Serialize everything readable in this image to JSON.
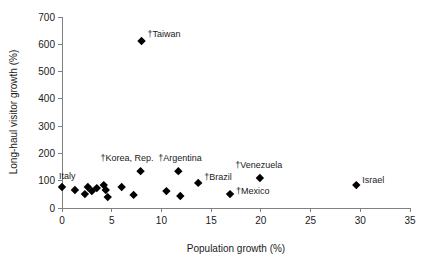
{
  "chart_data": {
    "type": "scatter",
    "title": "",
    "xlabel": "Population growth (%)",
    "ylabel": "Long-haul visitor growth (%)",
    "xlim": [
      0,
      35
    ],
    "ylim": [
      0,
      700
    ],
    "xticks": [
      0,
      5,
      10,
      15,
      20,
      25,
      30,
      35
    ],
    "yticks": [
      0,
      100,
      200,
      300,
      400,
      500,
      600,
      700
    ],
    "grid": false,
    "legend": "none",
    "marker": "filled-diamond",
    "marker_color": "#000000",
    "points": [
      {
        "label": "Italy",
        "label_text": "Italy",
        "x": 0.0,
        "y": 77,
        "label_dx": -3,
        "label_dy": -8,
        "anchor": "start"
      },
      {
        "label": "",
        "label_text": "",
        "x": 1.3,
        "y": 66,
        "label_dx": 0,
        "label_dy": 0,
        "anchor": "start"
      },
      {
        "label": "",
        "label_text": "",
        "x": 2.3,
        "y": 51,
        "label_dx": 0,
        "label_dy": 0,
        "anchor": "start"
      },
      {
        "label": "",
        "label_text": "",
        "x": 2.6,
        "y": 77,
        "label_dx": 0,
        "label_dy": 0,
        "anchor": "start"
      },
      {
        "label": "",
        "label_text": "",
        "x": 3.0,
        "y": 62,
        "label_dx": 0,
        "label_dy": 0,
        "anchor": "start"
      },
      {
        "label": "",
        "label_text": "",
        "x": 3.5,
        "y": 73,
        "label_dx": 0,
        "label_dy": 0,
        "anchor": "start"
      },
      {
        "label": "",
        "label_text": "",
        "x": 4.2,
        "y": 84,
        "label_dx": 0,
        "label_dy": 0,
        "anchor": "start"
      },
      {
        "label": "",
        "label_text": "",
        "x": 4.4,
        "y": 66,
        "label_dx": 0,
        "label_dy": 0,
        "anchor": "start"
      },
      {
        "label": "",
        "label_text": "",
        "x": 4.6,
        "y": 40,
        "label_dx": 0,
        "label_dy": 0,
        "anchor": "start"
      },
      {
        "label": "",
        "label_text": "",
        "x": 6.0,
        "y": 77,
        "label_dx": 0,
        "label_dy": 0,
        "anchor": "start"
      },
      {
        "label": "",
        "label_text": "",
        "x": 7.2,
        "y": 48,
        "label_dx": 0,
        "label_dy": 0,
        "anchor": "start"
      },
      {
        "label": "Taiwan",
        "label_text": "†Taiwan",
        "x": 8.0,
        "y": 612,
        "label_dx": 6,
        "label_dy": -4,
        "anchor": "start"
      },
      {
        "label": "Korea, Rep.",
        "label_text": "†Korea, Rep.",
        "x": 7.9,
        "y": 135,
        "label_dx": -40,
        "label_dy": -10,
        "anchor": "start"
      },
      {
        "label": "",
        "label_text": "",
        "x": 10.5,
        "y": 62,
        "label_dx": 0,
        "label_dy": 0,
        "anchor": "start"
      },
      {
        "label": "",
        "label_text": "",
        "x": 11.9,
        "y": 44,
        "label_dx": 0,
        "label_dy": 0,
        "anchor": "start"
      },
      {
        "label": "Argentina",
        "label_text": "†Argentina",
        "x": 11.7,
        "y": 135,
        "label_dx": -20,
        "label_dy": -10,
        "anchor": "start"
      },
      {
        "label": "Brazil",
        "label_text": "†Brazil",
        "x": 13.7,
        "y": 92,
        "label_dx": 6,
        "label_dy": -3,
        "anchor": "start"
      },
      {
        "label": "Mexico",
        "label_text": "†Mexico",
        "x": 16.9,
        "y": 51,
        "label_dx": 6,
        "label_dy": 0,
        "anchor": "start"
      },
      {
        "label": "Venezuela",
        "label_text": "†Venezuela",
        "x": 19.9,
        "y": 110,
        "label_dx": -1,
        "label_dy": -10,
        "anchor": "middle"
      },
      {
        "label": "Israel",
        "label_text": "Israel",
        "x": 29.6,
        "y": 84,
        "label_dx": 6,
        "label_dy": -2,
        "anchor": "start"
      }
    ]
  }
}
